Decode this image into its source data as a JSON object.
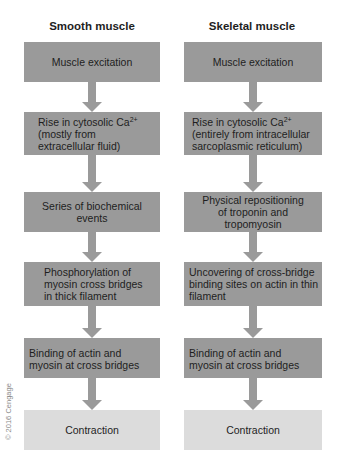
{
  "diagram": {
    "columns": [
      {
        "title": "Smooth muscle",
        "steps": [
          {
            "text": "Muscle excitation"
          },
          {
            "text": "Rise in cytosolic Ca",
            "sup": "2+",
            "text2": "(mostly from extracellular fluid)"
          },
          {
            "text": "Series of biochemical events"
          },
          {
            "text": "Phosphorylation of myosin cross bridges in thick filament"
          },
          {
            "text": "Binding of actin and myosin at cross bridges"
          },
          {
            "text": "Contraction"
          }
        ]
      },
      {
        "title": "Skeletal muscle",
        "steps": [
          {
            "text": "Muscle excitation"
          },
          {
            "text": "Rise in cytosolic Ca",
            "sup": "2+",
            "text2": "(entirely from intracellular sarcoplasmic reticulum)"
          },
          {
            "text": "Physical repositioning of troponin and tropomyosin"
          },
          {
            "text": "Uncovering of cross-bridge binding sites on actin in thin filament"
          },
          {
            "text": "Binding of actin and myosin at cross bridges"
          },
          {
            "text": "Contraction"
          }
        ]
      }
    ],
    "copyright": "© 2016 Cengage",
    "colors": {
      "step_box": "#9a9a9a",
      "final_box": "#dcdcdc",
      "arrow": "#9a9a9a"
    }
  }
}
